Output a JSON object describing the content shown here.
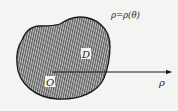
{
  "figure": {
    "curve_label": "ρ=ρ(θ)",
    "region_label": "D",
    "origin_label": "O",
    "axis_label": "ρ"
  },
  "colors": {
    "background": "#f4f4f2",
    "outline": "#1a1a1a",
    "hatch": "#555555",
    "hatch_bg": "#b8b8b8",
    "label_box": "#f4f4f2"
  }
}
